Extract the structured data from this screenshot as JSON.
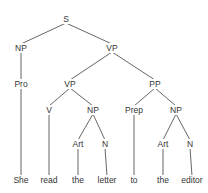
{
  "diagram": {
    "type": "syntax-tree",
    "sentence": "She read the letter to the editor",
    "nodes": [
      {
        "id": "S",
        "label": "S",
        "x": 66,
        "y": 19
      },
      {
        "id": "NP1",
        "label": "NP",
        "x": 21,
        "y": 48
      },
      {
        "id": "VP1",
        "label": "VP",
        "x": 112,
        "y": 48
      },
      {
        "id": "Pro",
        "label": "Pro",
        "x": 21,
        "y": 84
      },
      {
        "id": "VP2",
        "label": "VP",
        "x": 70,
        "y": 84
      },
      {
        "id": "PP",
        "label": "PP",
        "x": 155,
        "y": 84
      },
      {
        "id": "V",
        "label": "V",
        "x": 49,
        "y": 110
      },
      {
        "id": "NP2",
        "label": "NP",
        "x": 93,
        "y": 110
      },
      {
        "id": "Prep",
        "label": "Prep",
        "x": 134,
        "y": 110
      },
      {
        "id": "NP3",
        "label": "NP",
        "x": 176,
        "y": 110
      },
      {
        "id": "Art1",
        "label": "Art",
        "x": 78,
        "y": 144
      },
      {
        "id": "N1",
        "label": "N",
        "x": 105,
        "y": 144
      },
      {
        "id": "Art2",
        "label": "Art",
        "x": 163,
        "y": 144
      },
      {
        "id": "N2",
        "label": "N",
        "x": 190,
        "y": 144
      },
      {
        "id": "w1",
        "label": "She",
        "x": 21,
        "y": 180,
        "leaf": true
      },
      {
        "id": "w2",
        "label": "read",
        "x": 49,
        "y": 180,
        "leaf": true
      },
      {
        "id": "w3",
        "label": "the",
        "x": 78,
        "y": 180,
        "leaf": true
      },
      {
        "id": "w4",
        "label": "letter",
        "x": 107,
        "y": 180,
        "leaf": true
      },
      {
        "id": "w5",
        "label": "to",
        "x": 134,
        "y": 180,
        "leaf": true
      },
      {
        "id": "w6",
        "label": "the",
        "x": 163,
        "y": 180,
        "leaf": true
      },
      {
        "id": "w7",
        "label": "editor",
        "x": 192,
        "y": 180,
        "leaf": true
      }
    ],
    "edges": [
      [
        "S",
        "NP1"
      ],
      [
        "S",
        "VP1"
      ],
      [
        "NP1",
        "Pro"
      ],
      [
        "Pro",
        "w1"
      ],
      [
        "VP1",
        "VP2"
      ],
      [
        "VP1",
        "PP"
      ],
      [
        "VP2",
        "V"
      ],
      [
        "VP2",
        "NP2"
      ],
      [
        "V",
        "w2"
      ],
      [
        "NP2",
        "Art1"
      ],
      [
        "NP2",
        "N1"
      ],
      [
        "Art1",
        "w3"
      ],
      [
        "N1",
        "w4"
      ],
      [
        "PP",
        "Prep"
      ],
      [
        "PP",
        "NP3"
      ],
      [
        "Prep",
        "w5"
      ],
      [
        "NP3",
        "Art2"
      ],
      [
        "NP3",
        "N2"
      ],
      [
        "Art2",
        "w6"
      ],
      [
        "N2",
        "w7"
      ]
    ],
    "colors": {
      "line": "#555555",
      "text": "#333333",
      "background": "#ffffff"
    }
  }
}
